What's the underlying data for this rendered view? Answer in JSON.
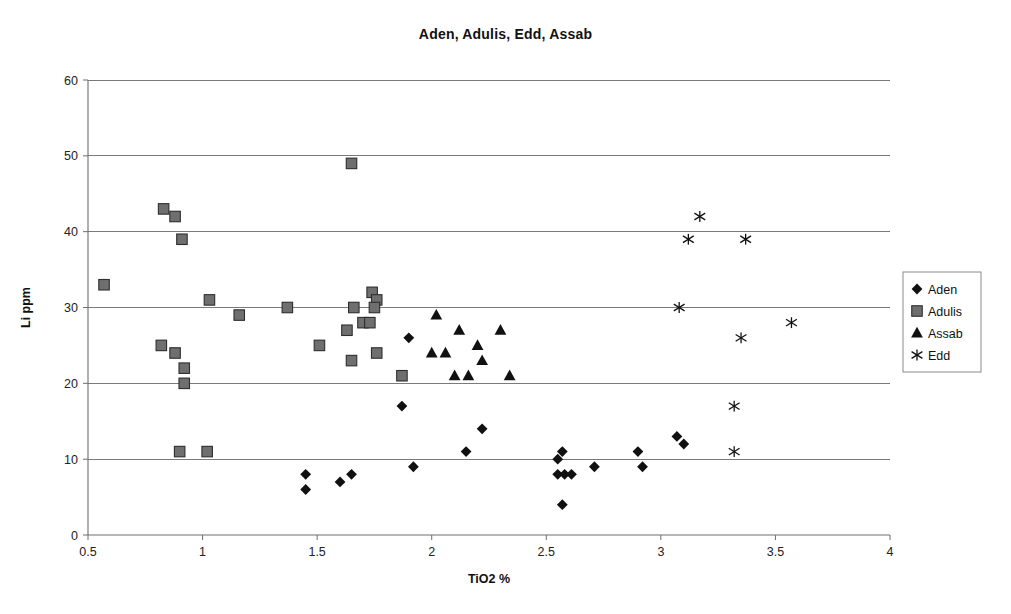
{
  "chart_data": {
    "type": "scatter",
    "title": "Aden, Adulis, Edd, Assab",
    "xlabel": "TiO2 %",
    "ylabel": "Li ppm",
    "xlim": [
      0.5,
      4
    ],
    "ylim": [
      0,
      60
    ],
    "xticks": [
      "0.5",
      "1",
      "1.5",
      "2",
      "2.5",
      "3",
      "3.5",
      "4"
    ],
    "xtick_values": [
      0.5,
      1,
      1.5,
      2,
      2.5,
      3,
      3.5,
      4
    ],
    "yticks": [
      "0",
      "10",
      "20",
      "30",
      "40",
      "50",
      "60"
    ],
    "ytick_values": [
      0,
      10,
      20,
      30,
      40,
      50,
      60
    ],
    "grid": "horizontal",
    "legend_position": "right",
    "series": [
      {
        "name": "Aden",
        "marker": "diamond",
        "color": "#111111",
        "points": [
          [
            1.45,
            8
          ],
          [
            1.45,
            6
          ],
          [
            1.6,
            7
          ],
          [
            1.65,
            8
          ],
          [
            1.87,
            17
          ],
          [
            1.9,
            26
          ],
          [
            1.92,
            9
          ],
          [
            2.15,
            11
          ],
          [
            2.22,
            14
          ],
          [
            2.55,
            10
          ],
          [
            2.57,
            11
          ],
          [
            2.55,
            8
          ],
          [
            2.58,
            8
          ],
          [
            2.61,
            8
          ],
          [
            2.57,
            4
          ],
          [
            2.71,
            9
          ],
          [
            2.9,
            11
          ],
          [
            2.92,
            9
          ],
          [
            3.07,
            13
          ],
          [
            3.1,
            12
          ]
        ]
      },
      {
        "name": "Adulis",
        "marker": "square",
        "color": "#6f6f6f",
        "points": [
          [
            0.57,
            33
          ],
          [
            0.83,
            43
          ],
          [
            0.88,
            42
          ],
          [
            0.91,
            39
          ],
          [
            0.82,
            25
          ],
          [
            0.88,
            24
          ],
          [
            0.92,
            22
          ],
          [
            0.92,
            20
          ],
          [
            0.9,
            11
          ],
          [
            1.02,
            11
          ],
          [
            1.03,
            31
          ],
          [
            1.16,
            29
          ],
          [
            1.37,
            30
          ],
          [
            1.51,
            25
          ],
          [
            1.65,
            49
          ],
          [
            1.63,
            27
          ],
          [
            1.66,
            30
          ],
          [
            1.7,
            28
          ],
          [
            1.73,
            28
          ],
          [
            1.74,
            32
          ],
          [
            1.76,
            31
          ],
          [
            1.75,
            30
          ],
          [
            1.65,
            23
          ],
          [
            1.76,
            24
          ],
          [
            1.87,
            21
          ]
        ]
      },
      {
        "name": "Assab",
        "marker": "triangle",
        "color": "#111111",
        "points": [
          [
            2.02,
            29
          ],
          [
            2.0,
            24
          ],
          [
            2.06,
            24
          ],
          [
            2.12,
            27
          ],
          [
            2.1,
            21
          ],
          [
            2.16,
            21
          ],
          [
            2.2,
            25
          ],
          [
            2.22,
            23
          ],
          [
            2.3,
            27
          ],
          [
            2.34,
            21
          ]
        ]
      },
      {
        "name": "Edd",
        "marker": "star",
        "color": "#111111",
        "points": [
          [
            3.17,
            42
          ],
          [
            3.12,
            39
          ],
          [
            3.37,
            39
          ],
          [
            3.08,
            30
          ],
          [
            3.57,
            28
          ],
          [
            3.35,
            26
          ],
          [
            3.32,
            17
          ],
          [
            3.32,
            11
          ]
        ]
      }
    ]
  },
  "legend": {
    "entries": [
      {
        "label": "Aden"
      },
      {
        "label": "Adulis"
      },
      {
        "label": "Assab"
      },
      {
        "label": "Edd"
      }
    ]
  }
}
